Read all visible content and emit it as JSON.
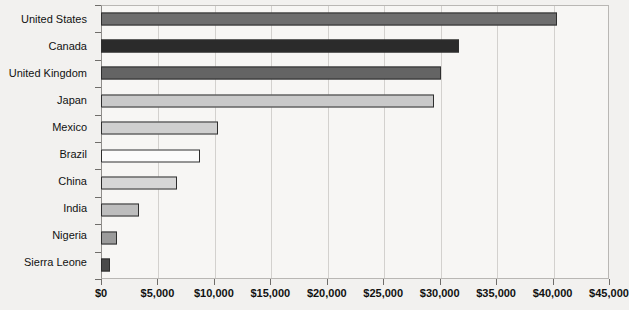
{
  "chart_data": {
    "type": "bar",
    "orientation": "horizontal",
    "title": "",
    "xlabel": "",
    "ylabel": "",
    "xlim": [
      0,
      45000
    ],
    "xticks": [
      0,
      5000,
      10000,
      15000,
      20000,
      25000,
      30000,
      35000,
      40000,
      45000
    ],
    "xtick_labels": [
      "$0",
      "$5,000",
      "$10,000",
      "$15,000",
      "$20,000",
      "$25,000",
      "$30,000",
      "$35,000",
      "$40,000",
      "$45,000"
    ],
    "grid": true,
    "legend": "none",
    "categories": [
      "United States",
      "Canada",
      "United Kingdom",
      "Japan",
      "Mexico",
      "Brazil",
      "China",
      "India",
      "Nigeria",
      "Sierra Leone"
    ],
    "values": [
      40400,
      31700,
      30100,
      29500,
      10400,
      8800,
      6700,
      3400,
      1400,
      800
    ],
    "bar_colors": [
      "#6e6e6e",
      "#2b2b2b",
      "#646464",
      "#c9c9c9",
      "#cfcfcf",
      "#fbfbfb",
      "#d6d6d6",
      "#bdbdbd",
      "#9b9b9b",
      "#4a4a4a"
    ],
    "bar_edge_color": "#2e2e2e",
    "plot_background": "#f7f6f4",
    "page_background": "#f2f1ef",
    "gridline_color": "#d3d1ce"
  }
}
